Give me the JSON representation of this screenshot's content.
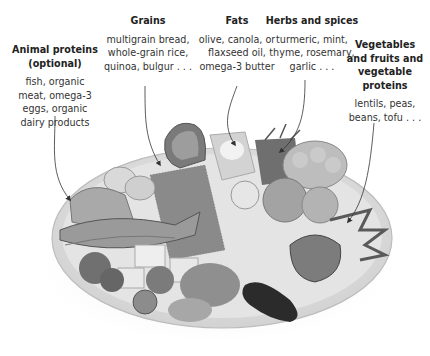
{
  "figure": {
    "type": "labeled food illustration",
    "image": "plate-of-foods-illustration"
  },
  "labels": [
    {
      "id": "animal-proteins",
      "title_lines": [
        "Animal proteins",
        "(optional)"
      ],
      "body_lines": [
        "fish, organic",
        "meat, omega-3",
        "eggs, organic",
        "dairy products"
      ]
    },
    {
      "id": "grains",
      "title_lines": [
        "Grains"
      ],
      "body_lines": [
        "multigrain bread,",
        "whole-grain rice,",
        "quinoa, bulgur . . ."
      ]
    },
    {
      "id": "fats",
      "title_lines": [
        "Fats"
      ],
      "body_lines": [
        "olive, canola, or",
        "flaxseed oil,",
        "omega-3 butter"
      ]
    },
    {
      "id": "herbs-spices",
      "title_lines": [
        "Herbs and spices"
      ],
      "body_lines": [
        "turmeric, mint,",
        "thyme, rosemary,",
        "garlic . . ."
      ]
    },
    {
      "id": "vegetables",
      "title_lines": [
        "Vegetables",
        "and fruits and",
        "vegetable",
        "proteins"
      ],
      "body_lines": [
        "lentils, peas,",
        "beans, tofu . . ."
      ]
    }
  ],
  "colors": {
    "text": "#222222",
    "arrow": "#333333",
    "plate_rim": "#d8d8d8",
    "plate": "#ececec",
    "shadow": "#e2e2e2"
  }
}
